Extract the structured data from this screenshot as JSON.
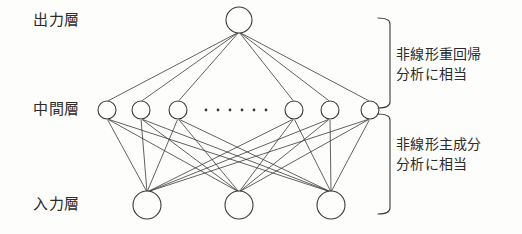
{
  "figure": {
    "type": "neural-network-diagram",
    "background_color": "#fdfdfb",
    "stroke_color": "#3a3a3a",
    "text_color": "#2b2b2b"
  },
  "layers": {
    "output": {
      "label": "出力層",
      "node_count": 1,
      "node_radius": 13,
      "y": 20,
      "node_x": [
        239
      ]
    },
    "hidden": {
      "label": "中間層",
      "node_count": 6,
      "node_radius": 9,
      "y": 110,
      "node_x": [
        107,
        141,
        178,
        294,
        330,
        370
      ],
      "ellipsis": {
        "name": "hidden-layer-ellipsis",
        "dot_count": 6,
        "dot_x": [
          206,
          218,
          230,
          242,
          254,
          266
        ],
        "dot_y": 110,
        "dot_radius": 1.4
      }
    },
    "input": {
      "label": "入力層",
      "node_count": 3,
      "node_radius": 14,
      "y": 205,
      "node_x": [
        147,
        239,
        331
      ]
    }
  },
  "connections": {
    "output_to_hidden": "full",
    "hidden_to_input": "full"
  },
  "braces": [
    {
      "name": "upper-brace",
      "x": 378,
      "y_top": 18,
      "y_bottom": 108,
      "width": 12
    },
    {
      "name": "lower-brace",
      "x": 378,
      "y_top": 114,
      "y_bottom": 214,
      "width": 12
    }
  ],
  "annotations": {
    "top": {
      "line1": "非線形重回帰",
      "line2": "分析に相当"
    },
    "bottom": {
      "line1": "非線形主成分",
      "line2": "分析に相当"
    }
  }
}
